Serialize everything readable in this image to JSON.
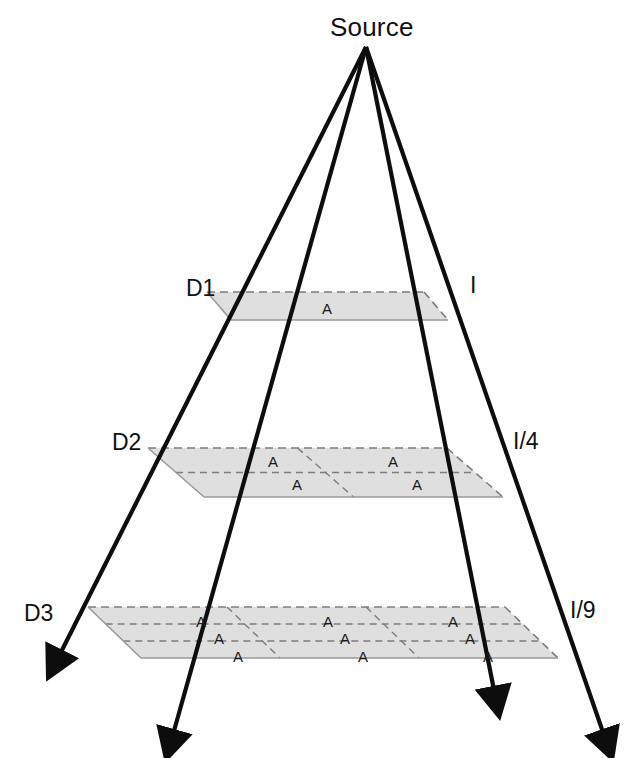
{
  "figure": {
    "title_label": "Source",
    "area_cell_label": "A"
  },
  "apex": {
    "x": 366,
    "y": 47
  },
  "distance_labels": [
    {
      "id": "d1",
      "text": "D1",
      "x": 186,
      "y": 275
    },
    {
      "id": "d2",
      "text": "D2",
      "x": 112,
      "y": 429
    },
    {
      "id": "d3",
      "text": "D3",
      "x": 24,
      "y": 600
    }
  ],
  "intensity_labels": [
    {
      "id": "i1",
      "text": "I",
      "x": 470,
      "y": 272
    },
    {
      "id": "i2",
      "text": "I/4",
      "x": 513,
      "y": 428
    },
    {
      "id": "i3",
      "text": "I/9",
      "x": 570,
      "y": 597
    }
  ],
  "planes": [
    {
      "id": "plane-d1",
      "distance": "D1",
      "intensity": "I",
      "cells_across": 1,
      "cells_deep": 1,
      "cell_count": 1,
      "corners": {
        "back_left": [
          207,
          292
        ],
        "back_right": [
          424,
          292
        ],
        "front_right": [
          448,
          320
        ],
        "front_left": [
          231,
          320
        ]
      },
      "cell_labels": [
        {
          "text": "A",
          "x": 322,
          "y": 300
        }
      ]
    },
    {
      "id": "plane-d2",
      "distance": "D2",
      "intensity": "I/4",
      "cells_across": 2,
      "cells_deep": 2,
      "cell_count": 4,
      "corners": {
        "back_left": [
          148,
          448
        ],
        "back_right": [
          447,
          448
        ],
        "front_right": [
          503,
          497
        ],
        "front_left": [
          204,
          497
        ]
      },
      "cell_labels": [
        {
          "text": "A",
          "x": 268,
          "y": 453
        },
        {
          "text": "A",
          "x": 388,
          "y": 453
        },
        {
          "text": "A",
          "x": 292,
          "y": 476
        },
        {
          "text": "A",
          "x": 412,
          "y": 476
        }
      ]
    },
    {
      "id": "plane-d3",
      "distance": "D3",
      "intensity": "I/9",
      "cells_across": 3,
      "cells_deep": 3,
      "cell_count": 9,
      "corners": {
        "back_left": [
          88,
          607
        ],
        "back_right": [
          505,
          607
        ],
        "front_right": [
          558,
          658
        ],
        "front_left": [
          141,
          658
        ]
      },
      "cell_labels": [
        {
          "text": "A",
          "x": 196,
          "y": 613
        },
        {
          "text": "A",
          "x": 323,
          "y": 613
        },
        {
          "text": "A",
          "x": 448,
          "y": 613
        },
        {
          "text": "A",
          "x": 214,
          "y": 630
        },
        {
          "text": "A",
          "x": 340,
          "y": 630
        },
        {
          "text": "A",
          "x": 465,
          "y": 630
        },
        {
          "text": "A",
          "x": 233,
          "y": 648
        },
        {
          "text": "A",
          "x": 358,
          "y": 648
        },
        {
          "text": "A",
          "x": 483,
          "y": 648
        }
      ]
    }
  ],
  "rays": [
    {
      "id": "ray-left",
      "name": "ray-to-front-left",
      "to": [
        58,
        658
      ]
    },
    {
      "id": "ray-inner-left",
      "name": "ray-to-back-left",
      "to": [
        172,
        738
      ]
    },
    {
      "id": "ray-inner-right",
      "name": "ray-to-front-right",
      "to": [
        495,
        695
      ]
    },
    {
      "id": "ray-right",
      "name": "ray-to-back-right",
      "to": [
        605,
        738
      ]
    }
  ],
  "colors": {
    "plane_fill": "#d9d9d9",
    "plane_fill_light": "#e4e4e4",
    "plane_edge_solid": "#9a9a9a",
    "plane_edge_dashed": "#7d7d7d",
    "ray_stroke": "#0d0d0d",
    "text": "#111111",
    "background": "#ffffff"
  }
}
